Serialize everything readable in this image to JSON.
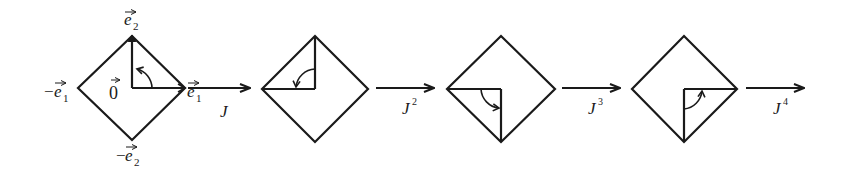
{
  "figure": {
    "stroke_color": "#1a1a1a",
    "background": "#ffffff",
    "diamond1_labels": {
      "top": "e",
      "top_sub": "2",
      "bottom_prefix": "−",
      "bottom": "e",
      "bottom_sub": "2",
      "left_prefix": "−",
      "left": "e",
      "left_sub": "1",
      "right": "e",
      "right_sub": "1",
      "center": "0"
    },
    "arrows": [
      {
        "label": "J",
        "sup": ""
      },
      {
        "label": "J",
        "sup": "2"
      },
      {
        "label": "J",
        "sup": "3"
      },
      {
        "label": "J",
        "sup": "4"
      }
    ]
  }
}
